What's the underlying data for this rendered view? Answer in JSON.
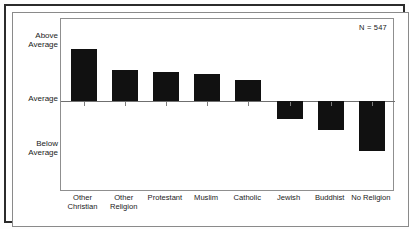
{
  "chart_data": {
    "type": "bar",
    "title": "",
    "subtitle": "",
    "xlabel": "",
    "ylabel": "",
    "categories": [
      "Other Christian",
      "Other Religion",
      "Protestant",
      "Muslim",
      "Catholic",
      "Jewish",
      "Buddhist",
      "No Religion"
    ],
    "category_lines": [
      [
        "Other",
        "Christian"
      ],
      [
        "Other",
        "Religion"
      ],
      [
        "Protestant"
      ],
      [
        "Muslim"
      ],
      [
        "Catholic"
      ],
      [
        "Jewish"
      ],
      [
        "Buddhist"
      ],
      [
        "No Religion"
      ]
    ],
    "values": [
      0.96,
      0.58,
      0.54,
      0.5,
      0.39,
      -0.34,
      -0.53,
      -0.93
    ],
    "ylim": [
      -1.15,
      1.05
    ],
    "ytick_labels": [
      "Above Average",
      "Average",
      "Below Average"
    ],
    "ytick_values": [
      1.0,
      0.0,
      -1.0
    ],
    "grid": false,
    "legend": "none",
    "annotations": [
      "N = 547"
    ],
    "bar_color": "#111111",
    "axis_color": "#6f6f6f",
    "background_color": "#ffffff"
  },
  "axis": {
    "y_top_label_line1": "Above",
    "y_top_label_line2": "Average",
    "y_mid_label": "Average",
    "y_bottom_label_line1": "Below",
    "y_bottom_label_line2": "Average"
  },
  "annotation": {
    "sample_size": "N = 547"
  }
}
